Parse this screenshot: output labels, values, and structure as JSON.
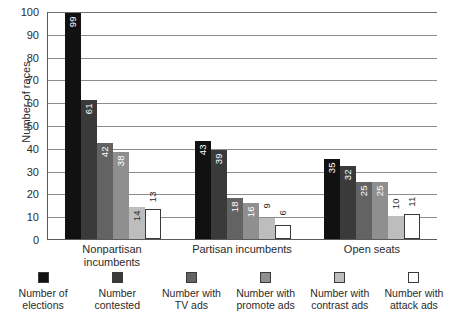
{
  "chart_data": {
    "type": "bar",
    "title": "",
    "xlabel": "",
    "ylabel": "Number of races",
    "ylim": [
      0,
      100
    ],
    "ytick_step": 10,
    "yticks": [
      100,
      90,
      80,
      70,
      60,
      50,
      40,
      30,
      20,
      10,
      0
    ],
    "grid": true,
    "legend_position": "bottom",
    "categories": [
      "Nonpartisan\nincumbents",
      "Partisan incumbents",
      "Open seats"
    ],
    "series": [
      {
        "name": "Number of\nelections",
        "color": "#111111",
        "values": [
          99,
          43,
          35
        ]
      },
      {
        "name": "Number\ncontested",
        "color": "#3a3a3a",
        "values": [
          61,
          39,
          32
        ]
      },
      {
        "name": "Number with\nTV ads",
        "color": "#636363",
        "values": [
          42,
          18,
          25
        ]
      },
      {
        "name": "Number with\npromote ads",
        "color": "#8f8f8f",
        "values": [
          38,
          16,
          25
        ]
      },
      {
        "name": "Number with\ncontrast ads",
        "color": "#bdbdbd",
        "values": [
          14,
          9,
          10
        ]
      },
      {
        "name": "Number with\nattack ads",
        "color": "#ffffff",
        "values": [
          13,
          6,
          11
        ]
      }
    ]
  },
  "legend": {
    "items": [
      {
        "label": "Number of\nelections"
      },
      {
        "label": "Number\ncontested"
      },
      {
        "label": "Number with\nTV ads"
      },
      {
        "label": "Number with\npromote ads"
      },
      {
        "label": "Number with\ncontrast ads"
      },
      {
        "label": "Number with\nattack ads"
      }
    ]
  }
}
